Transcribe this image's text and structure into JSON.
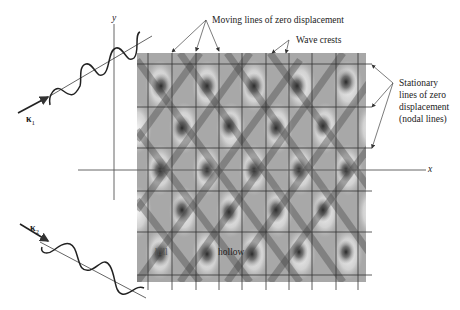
{
  "figure": {
    "type": "interference-pattern-diagram",
    "axes": {
      "x_label": "x",
      "y_label": "y"
    },
    "wave_vectors": [
      {
        "label": "κ",
        "subscript": "1"
      },
      {
        "label": "κ",
        "subscript": "2"
      }
    ],
    "annotations": {
      "moving_lines": "Moving lines of zero displacement",
      "wave_crests": "Wave crests",
      "stationary_line1": "Stationary",
      "stationary_line2": "lines of zero",
      "stationary_line3": "displacement",
      "stationary_line4": "(nodal lines)",
      "hill": "hill",
      "hollow": "hollow"
    },
    "colors": {
      "pattern_dark": "#2a2a2a",
      "pattern_light": "#e6e6e6",
      "grid_line": "#333333",
      "axis_line": "#555555",
      "wave_line": "#222222"
    }
  }
}
